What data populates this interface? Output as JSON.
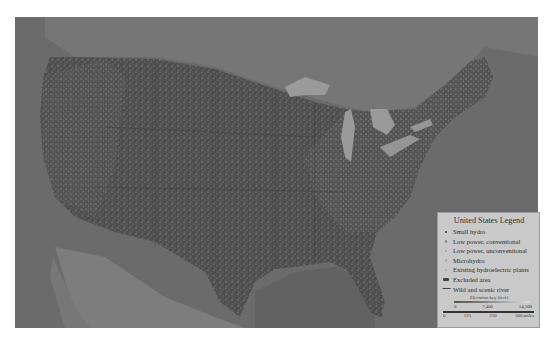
{
  "map": {
    "subject": "United States hydropower resource map",
    "colors": {
      "ocean": "#6b6b6b",
      "canada_land": "#787878",
      "us_land": "#4f4f4f",
      "mexico_land": "#7d7d7d",
      "lakes": "#9a9a9a",
      "legend_bg": "#c9c9c9"
    }
  },
  "legend": {
    "title": "United States Legend",
    "items": [
      {
        "symbol": "dot-dark",
        "label": "Small hydro"
      },
      {
        "symbol": "dot-medium",
        "label": "Low power, conventional"
      },
      {
        "symbol": "dot-light",
        "label": "Low power, unconventional"
      },
      {
        "symbol": "dot-light",
        "label": "Microhydro"
      },
      {
        "symbol": "dot-light",
        "label": "Existing hydroelectric plants"
      },
      {
        "symbol": "blob-dark",
        "label": "Excluded area"
      },
      {
        "symbol": "river-line",
        "label": "Wild and scenic river"
      }
    ],
    "elevation_key": {
      "label": "Elevation key (feet)",
      "ticks": [
        "0",
        "7,400",
        "14,500"
      ]
    },
    "scale": {
      "ticks": [
        "0",
        "125",
        "250",
        "500 miles"
      ]
    }
  }
}
